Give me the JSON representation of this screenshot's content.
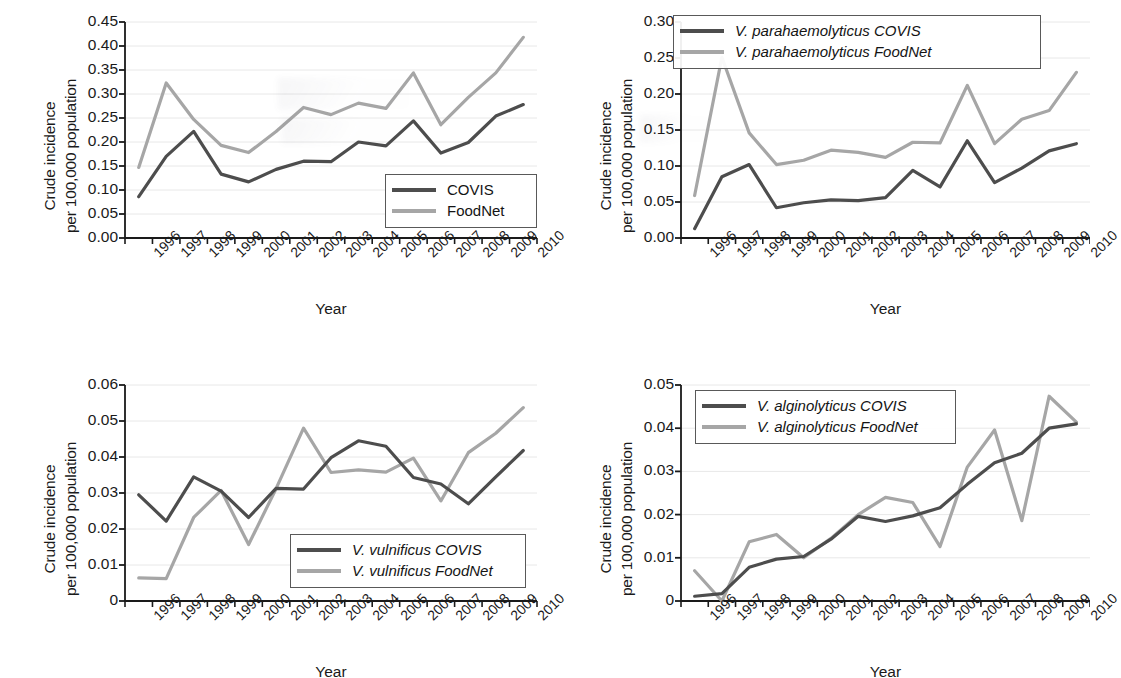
{
  "figure": {
    "panel_count": 4,
    "axis_y_label_line1": "Crude incidence",
    "axis_y_label_line2": "per 100,000 population",
    "axis_x_label": "Year",
    "colors": {
      "covis": "#4d4d4d",
      "foodnet": "#a6a6a6",
      "axis": "#1a1a1a",
      "grid": "#e8e8e8"
    }
  },
  "chart_data": [
    {
      "id": "panel-total-vibrio",
      "type": "line",
      "title": "",
      "xlabel": "Year",
      "ylabel": "Crude incidence per 100,000 population",
      "x": [
        "1996",
        "1997",
        "1998",
        "1999",
        "2000",
        "2001",
        "2002",
        "2003",
        "2004",
        "2005",
        "2006",
        "2007",
        "2008",
        "2009",
        "2010"
      ],
      "ylim": [
        0,
        0.45
      ],
      "yticks": [
        "0.00",
        "0.05",
        "0.10",
        "0.15",
        "0.20",
        "0.25",
        "0.30",
        "0.35",
        "0.40",
        "0.45"
      ],
      "grid": true,
      "legend_position": "bottom-right",
      "series": [
        {
          "name": "COVIS",
          "color": "#4d4d4d",
          "values": [
            0.086,
            0.17,
            0.222,
            0.133,
            0.117,
            0.143,
            0.16,
            0.159,
            0.2,
            0.192,
            0.244,
            0.177,
            0.199,
            0.254,
            0.278
          ]
        },
        {
          "name": "FoodNet",
          "color": "#a6a6a6",
          "values": [
            0.147,
            0.323,
            0.247,
            0.193,
            0.178,
            0.222,
            0.272,
            0.257,
            0.281,
            0.27,
            0.344,
            0.236,
            0.293,
            0.344,
            0.418
          ]
        }
      ]
    },
    {
      "id": "panel-v-parahaemolyticus",
      "type": "line",
      "title": "",
      "xlabel": "Year",
      "ylabel": "Crude incidence per 100,000 population",
      "x": [
        "1996",
        "1997",
        "1998",
        "1999",
        "2000",
        "2001",
        "2002",
        "2003",
        "2004",
        "2005",
        "2006",
        "2007",
        "2008",
        "2009",
        "2010"
      ],
      "ylim": [
        0,
        0.3
      ],
      "yticks": [
        "0.00",
        "0.05",
        "0.10",
        "0.15",
        "0.20",
        "0.25",
        "0.30"
      ],
      "grid": true,
      "legend_position": "top-right",
      "series": [
        {
          "name": "V. parahaemolyticus COVIS",
          "color": "#4d4d4d",
          "values": [
            0.013,
            0.085,
            0.102,
            0.042,
            0.049,
            0.053,
            0.052,
            0.056,
            0.094,
            0.071,
            0.135,
            0.077,
            0.097,
            0.121,
            0.131
          ]
        },
        {
          "name": "V. parahaemolyticus FoodNet",
          "color": "#a6a6a6",
          "values": [
            0.059,
            0.251,
            0.146,
            0.102,
            0.108,
            0.122,
            0.119,
            0.112,
            0.133,
            0.132,
            0.212,
            0.131,
            0.165,
            0.177,
            0.23
          ]
        }
      ]
    },
    {
      "id": "panel-v-vulnificus",
      "type": "line",
      "title": "",
      "xlabel": "Year",
      "ylabel": "Crude incidence per 100,000 population",
      "x": [
        "1996",
        "1997",
        "1998",
        "1999",
        "2000",
        "2001",
        "2002",
        "2003",
        "2004",
        "2005",
        "2006",
        "2007",
        "2008",
        "2009",
        "2010"
      ],
      "ylim": [
        0,
        0.06
      ],
      "yticks": [
        "0",
        "0.01",
        "0.02",
        "0.03",
        "0.04",
        "0.05",
        "0.06"
      ],
      "grid": true,
      "legend_position": "bottom-right",
      "series": [
        {
          "name": "V. vulnificus COVIS",
          "color": "#4d4d4d",
          "values": [
            0.0295,
            0.0222,
            0.0345,
            0.0305,
            0.0232,
            0.0313,
            0.0311,
            0.0398,
            0.0445,
            0.043,
            0.0343,
            0.0325,
            0.027,
            0.0345,
            0.0418
          ]
        },
        {
          "name": "V. vulnificus FoodNet",
          "color": "#a6a6a6",
          "values": [
            0.0064,
            0.0062,
            0.0232,
            0.0307,
            0.0157,
            0.0312,
            0.048,
            0.0357,
            0.0364,
            0.0358,
            0.0397,
            0.0278,
            0.0412,
            0.0466,
            0.0537
          ]
        }
      ]
    },
    {
      "id": "panel-v-alginolyticus",
      "type": "line",
      "title": "",
      "xlabel": "Year",
      "ylabel": "Crude incidence per 100,000 population",
      "x": [
        "1996",
        "1997",
        "1998",
        "1999",
        "2000",
        "2001",
        "2002",
        "2003",
        "2004",
        "2005",
        "2006",
        "2007",
        "2008",
        "2009",
        "2010"
      ],
      "ylim": [
        0,
        0.05
      ],
      "yticks": [
        "0",
        "0.01",
        "0.02",
        "0.03",
        "0.04",
        "0.05"
      ],
      "grid": true,
      "legend_position": "top-left",
      "series": [
        {
          "name": "V. alginolyticus COVIS",
          "color": "#4d4d4d",
          "values": [
            0.0011,
            0.0017,
            0.0078,
            0.0097,
            0.0103,
            0.0143,
            0.0196,
            0.0184,
            0.0197,
            0.0216,
            0.027,
            0.032,
            0.0342,
            0.04,
            0.041
          ]
        },
        {
          "name": "V. alginolyticus FoodNet",
          "color": "#a6a6a6",
          "values": [
            0.007,
            0.0,
            0.0137,
            0.0154,
            0.01,
            0.0145,
            0.02,
            0.024,
            0.0228,
            0.0126,
            0.031,
            0.0396,
            0.0186,
            0.0474,
            0.0414
          ]
        }
      ]
    }
  ]
}
